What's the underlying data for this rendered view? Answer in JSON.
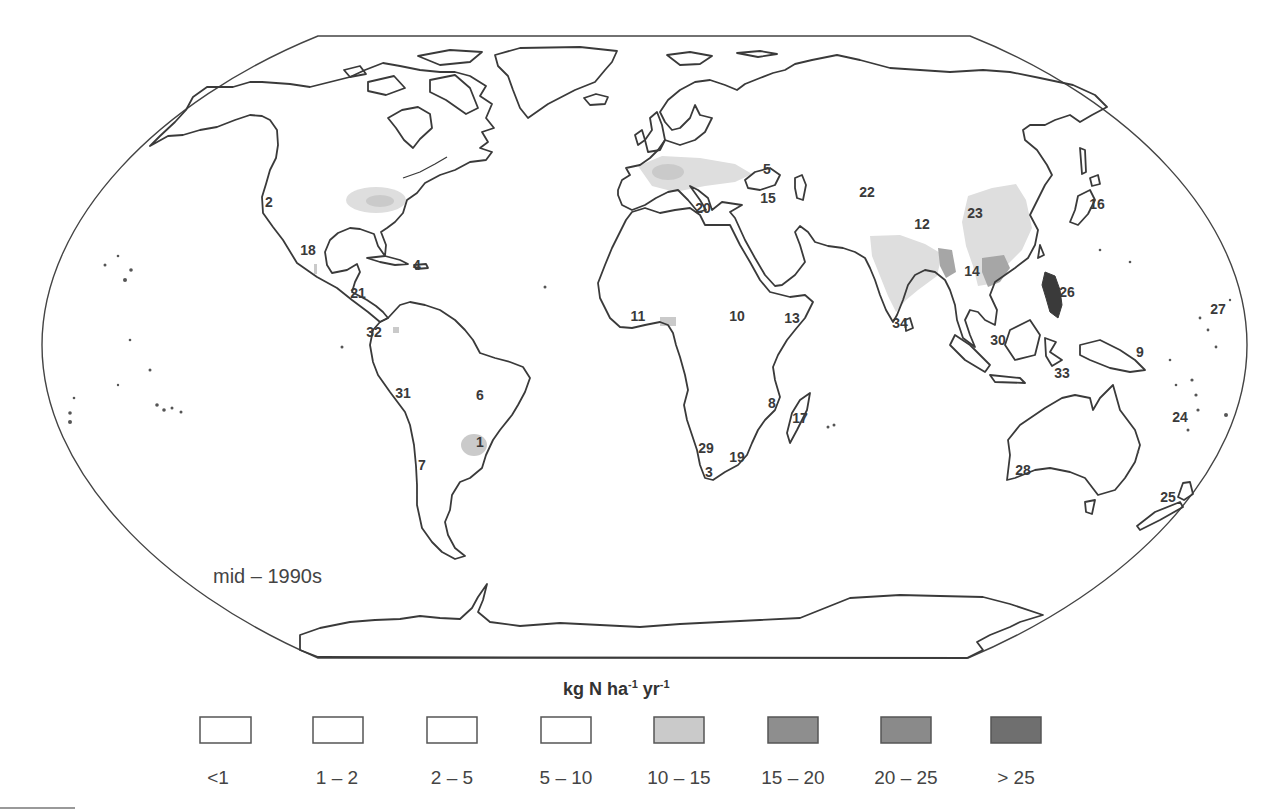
{
  "figure": {
    "period_label": "mid – 1990s"
  },
  "legend": {
    "title": {
      "base1": "kg N ha",
      "sup1": "-1",
      "base2": " yr",
      "sup2": "-1"
    },
    "items": [
      {
        "label": "<1",
        "color": "#ffffff"
      },
      {
        "label": "1 – 2",
        "color": "#ffffff"
      },
      {
        "label": "2 – 5",
        "color": "#ffffff"
      },
      {
        "label": "5 – 10",
        "color": "#ffffff"
      },
      {
        "label": "10 – 15",
        "color": "#cacaca"
      },
      {
        "label": "15 – 20",
        "color": "#8e8e8e"
      },
      {
        "label": "20 – 25",
        "color": "#8a8a8a"
      },
      {
        "label": "> 25",
        "color": "#6f6f6f"
      }
    ]
  },
  "map": {
    "shading": {
      "light": "#dedede",
      "medium_light": "#cacaca",
      "medium": "#a6a6a6",
      "dark": "#7a7a7a",
      "darkest": "#4a4a4a"
    },
    "site_labels": [
      "1",
      "2",
      "3",
      "4",
      "5",
      "6",
      "7",
      "8",
      "9",
      "10",
      "11",
      "12",
      "13",
      "14",
      "15",
      "16",
      "17",
      "18",
      "19",
      "20",
      "21",
      "22",
      "23",
      "24",
      "25",
      "26",
      "27",
      "28",
      "29",
      "30",
      "31",
      "32",
      "33",
      "34"
    ]
  }
}
